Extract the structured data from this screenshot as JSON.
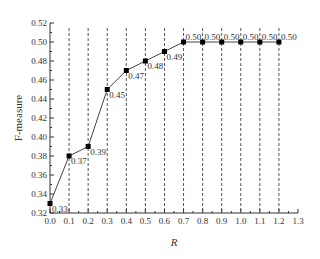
{
  "chart_data": {
    "type": "line",
    "title": "",
    "xlabel": "R",
    "ylabel": "F-measure",
    "x": [
      0.0,
      0.1,
      0.2,
      0.3,
      0.4,
      0.5,
      0.6,
      0.7,
      0.8,
      0.9,
      1.0,
      1.1,
      1.2
    ],
    "series": [
      {
        "name": "F-measure",
        "values": [
          0.33,
          0.38,
          0.39,
          0.45,
          0.47,
          0.48,
          0.49,
          0.5,
          0.5,
          0.5,
          0.5,
          0.5,
          0.5
        ]
      }
    ],
    "data_labels": [
      "0.33",
      "0.37",
      "0.39",
      "0.45",
      "0.47",
      "0.48",
      "0.49",
      "0.50",
      "0.50",
      "0.50",
      "0.50",
      "0.50",
      "0.50"
    ],
    "xlim": [
      0.0,
      1.3
    ],
    "ylim": [
      0.32,
      0.52
    ],
    "xticks": [
      "0.0",
      "0.1",
      "0.2",
      "0.3",
      "0.4",
      "0.5",
      "0.6",
      "0.7",
      "0.8",
      "0.9",
      "1.0",
      "1.1",
      "1.2",
      "1.3"
    ],
    "yticks": [
      "0.32",
      "0.34",
      "0.36",
      "0.38",
      "0.40",
      "0.42",
      "0.44",
      "0.46",
      "0.48",
      "0.50",
      "0.52"
    ],
    "grid": "vertical dashed at x=0.1..1.2",
    "legend": "none"
  }
}
